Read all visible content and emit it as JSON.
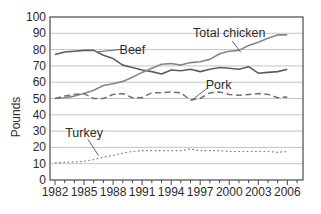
{
  "figure": {
    "kind": "scanned-textbook-line-graph",
    "ylabel": "Pounds"
  },
  "style": {
    "background": "#ffffff",
    "frame_color": "#4a4a4a",
    "grid_color": "#b5b5b5",
    "text_color": "#2b2b2b",
    "leader_color": "#4a4a4a"
  },
  "chart_data": {
    "type": "line",
    "title": "",
    "xlabel": "",
    "ylabel": "Pounds",
    "grid": "horizontal",
    "legend_position": "inline-annotations",
    "ylim": [
      0,
      100
    ],
    "y_tick_step": 10,
    "y_tick_labels": [
      "0",
      "10",
      "20",
      "30",
      "40",
      "50",
      "60",
      "70",
      "80",
      "90",
      "100"
    ],
    "x": [
      1982,
      1983,
      1984,
      1985,
      1986,
      1987,
      1988,
      1989,
      1990,
      1991,
      1992,
      1993,
      1994,
      1995,
      1996,
      1997,
      1998,
      1999,
      2000,
      2001,
      2002,
      2003,
      2004,
      2005,
      2006
    ],
    "x_tick_labels": [
      "1982",
      "1985",
      "1988",
      "1991",
      "1994",
      "1997",
      "2000",
      "2003",
      "2006"
    ],
    "x_minor_tick_every_year": true,
    "series": [
      {
        "name": "Beef",
        "line_style": "solid",
        "color": "#5d5d5d",
        "width": 1.6,
        "values": [
          77,
          78.5,
          79,
          79.5,
          79.5,
          76.5,
          74.5,
          70.5,
          69,
          67.5,
          66.5,
          65,
          67.5,
          67,
          68,
          66.5,
          68,
          69,
          68.5,
          68,
          69.5,
          65.5,
          66,
          66.5,
          68
        ]
      },
      {
        "name": "Total chicken",
        "line_style": "solid",
        "color": "#878787",
        "width": 1.6,
        "values": [
          50,
          50.5,
          51.5,
          53,
          55,
          58,
          59,
          60.5,
          63,
          66,
          68.5,
          71,
          71.5,
          70.5,
          72,
          72.5,
          74,
          77.5,
          79,
          79.5,
          82.5,
          84.5,
          87,
          89,
          89
        ]
      },
      {
        "name": "Pork",
        "line_style": "dashed",
        "color": "#6f6f6f",
        "width": 1.5,
        "values": [
          50,
          51.5,
          52.5,
          53,
          50,
          50,
          52.5,
          53,
          50.5,
          50.5,
          53.5,
          53.5,
          54,
          53.5,
          49,
          50,
          53.5,
          54,
          52.5,
          52,
          52.5,
          53,
          52.5,
          50.5,
          51
        ]
      },
      {
        "name": "Turkey",
        "line_style": "dotted",
        "color": "#787878",
        "width": 1.2,
        "values": [
          10.5,
          11,
          11,
          11.5,
          12.5,
          14,
          15,
          16.5,
          17.5,
          18,
          18,
          18,
          18,
          18,
          19,
          18,
          18,
          18,
          17.5,
          17.5,
          17.5,
          17.5,
          17.5,
          17,
          17.5
        ]
      }
    ],
    "annotations": [
      {
        "text": "Beef",
        "year": 1990.0,
        "value": 79.8,
        "leader": [
          [
            1988.8,
            80.1
          ],
          [
            1986.4,
            78.6
          ]
        ]
      },
      {
        "text": "Total chicken",
        "year": 2000.0,
        "value": 90.2,
        "leader": [
          [
            2000.3,
            85.3
          ],
          [
            2001.2,
            78.3
          ]
        ]
      },
      {
        "text": "Pork",
        "year": 1998.9,
        "value": 58.3,
        "leader": [
          [
            1997.7,
            56.2
          ],
          [
            1996.1,
            48.8
          ]
        ]
      },
      {
        "text": "Turkey",
        "year": 1985.0,
        "value": 28.8,
        "leader": [
          [
            1985.4,
            25.0
          ],
          [
            1986.5,
            15.0
          ]
        ]
      }
    ]
  }
}
